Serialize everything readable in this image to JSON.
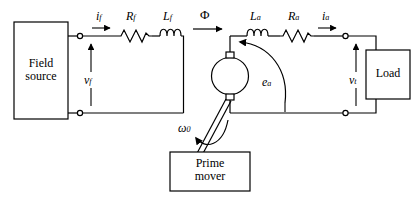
{
  "diagram": {
    "stroke_color": "#000000",
    "background": "#ffffff"
  },
  "blocks": {
    "field_source": {
      "label": "Field\nsource"
    },
    "load": {
      "label": "Load"
    },
    "prime_mover": {
      "label": "Prime\nmover"
    }
  },
  "components": {
    "field_resistor": {
      "base": "R",
      "sub": "f"
    },
    "field_inductor": {
      "base": "L",
      "sub": "f"
    },
    "armature_inductor": {
      "base": "L",
      "sub": "a"
    },
    "armature_resistor": {
      "base": "R",
      "sub": "a"
    }
  },
  "signals": {
    "field_current": {
      "base": "i",
      "sub": "f"
    },
    "field_voltage": {
      "base": "v",
      "sub": "f"
    },
    "armature_current": {
      "base": "i",
      "sub": "a"
    },
    "terminal_voltage": {
      "base": "v",
      "sub": "t"
    },
    "induced_emf": {
      "base": "e",
      "sub": "a"
    },
    "flux": {
      "base": "Φ",
      "sub": ""
    },
    "angular_speed": {
      "base": "ω",
      "sub": "0"
    }
  },
  "machine": {
    "name": "dc-machine-armature",
    "symbol": "circle-with-brushes"
  }
}
